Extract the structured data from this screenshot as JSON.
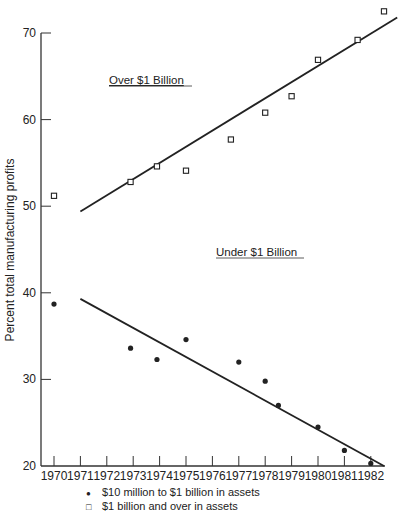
{
  "chart_data": {
    "type": "scatter",
    "title": "",
    "xlabel": "",
    "ylabel": "Percent total manufacturing profits",
    "ylim": [
      20,
      70
    ],
    "yticks": [
      20,
      30,
      40,
      50,
      60,
      70
    ],
    "x": [
      "1970",
      "1971",
      "1972",
      "1973",
      "1974",
      "1975",
      "1976",
      "1977",
      "1978",
      "1979",
      "1980",
      "1981",
      "1982"
    ],
    "grid": false,
    "legend_position": "bottom",
    "series": [
      {
        "name": "$10 million to $1 billion in assets",
        "marker": "filled-circle",
        "points": [
          {
            "x": 1970,
            "y": 38.7
          },
          {
            "x": 1972.9,
            "y": 33.6
          },
          {
            "x": 1973.9,
            "y": 32.3
          },
          {
            "x": 1975,
            "y": 34.6
          },
          {
            "x": 1977,
            "y": 32.0
          },
          {
            "x": 1978,
            "y": 29.8
          },
          {
            "x": 1978.5,
            "y": 27.0
          },
          {
            "x": 1980,
            "y": 24.5
          },
          {
            "x": 1981,
            "y": 21.8
          },
          {
            "x": 1982,
            "y": 20.3
          }
        ],
        "trend_line": {
          "from": {
            "x": 1971,
            "y": 39.3
          },
          "to": {
            "x": 1982.5,
            "y": 20.0
          }
        },
        "annotation": "Under $1 Billion"
      },
      {
        "name": "$1 billion and over in assets",
        "marker": "open-square",
        "points": [
          {
            "x": 1970,
            "y": 51.2
          },
          {
            "x": 1972.9,
            "y": 52.8
          },
          {
            "x": 1973.9,
            "y": 54.6
          },
          {
            "x": 1975,
            "y": 54.1
          },
          {
            "x": 1976.7,
            "y": 57.7
          },
          {
            "x": 1978,
            "y": 60.8
          },
          {
            "x": 1979,
            "y": 62.7
          },
          {
            "x": 1980,
            "y": 66.9
          },
          {
            "x": 1981.5,
            "y": 69.2
          },
          {
            "x": 1982.5,
            "y": 72.5
          }
        ],
        "trend_line": {
          "from": {
            "x": 1971,
            "y": 49.4
          },
          "to": {
            "x": 1983,
            "y": 71.8
          }
        },
        "annotation": "Over $1 Billion"
      }
    ]
  },
  "labels": {
    "ylabel": "Percent total manufacturing profits",
    "annot_over": "Over $1 Billion",
    "annot_under": "Under $1 Billion",
    "legend_dot_sym": "●",
    "legend_dot": "$10 million to $1 billion in assets",
    "legend_sq_sym": "□",
    "legend_sq": "$1 billion and over in assets"
  }
}
